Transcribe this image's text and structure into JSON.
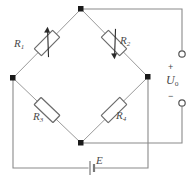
{
  "diagram": {
    "type": "circuit-schematic"
  },
  "resistors": [
    {
      "id": "R1",
      "label": "R",
      "subscript": "1",
      "position": "upper-left",
      "arrow": "up",
      "name": "resistor-r1"
    },
    {
      "id": "R2",
      "label": "R",
      "subscript": "2",
      "position": "upper-right",
      "arrow": "down",
      "name": "resistor-r2"
    },
    {
      "id": "R3",
      "label": "R",
      "subscript": "3",
      "position": "lower-left",
      "arrow": "none",
      "name": "resistor-r3"
    },
    {
      "id": "R4",
      "label": "R",
      "subscript": "4",
      "position": "lower-right",
      "arrow": "none",
      "name": "resistor-r4"
    }
  ],
  "output": {
    "label": "U",
    "subscript": "o",
    "plus_sign": "+",
    "minus_sign": "−",
    "terminal_top_name": "output-terminal-positive",
    "terminal_bottom_name": "output-terminal-negative"
  },
  "source": {
    "label": "E",
    "type": "battery"
  },
  "nodes": [
    {
      "name": "node-top",
      "x": 81,
      "y": 9
    },
    {
      "name": "node-left",
      "x": 13,
      "y": 78
    },
    {
      "name": "node-right",
      "x": 148,
      "y": 77
    },
    {
      "name": "node-bottom",
      "x": 81,
      "y": 143
    }
  ],
  "colors": {
    "wire": "#8a8a8a",
    "node": "#1a1a1a",
    "resistor_outline": "#6b6b6b",
    "text": "#4a4a4a",
    "background": "#ffffff"
  }
}
